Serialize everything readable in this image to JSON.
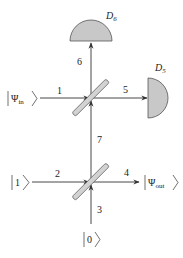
{
  "diagram": {
    "type": "optical-interferometer",
    "colors": {
      "beam": "#333333",
      "detector_fill": "#c8c8c8",
      "detector_stroke": "#555555",
      "splitter_fill": "#d2d2d2",
      "splitter_stroke": "#555555"
    },
    "detectors": [
      {
        "id": "D6",
        "label": "D",
        "subscript": "6"
      },
      {
        "id": "D5",
        "label": "D",
        "subscript": "5"
      }
    ],
    "states": {
      "psi_in": {
        "symbol": "Ψ",
        "subscript": "in"
      },
      "psi_out": {
        "symbol": "Ψ",
        "subscript": "out"
      },
      "one": {
        "symbol": "1"
      },
      "zero": {
        "symbol": "0"
      }
    },
    "beam_labels": {
      "b1": "1",
      "b2": "2",
      "b3": "3",
      "b4": "4",
      "b5": "5",
      "b6": "6",
      "b7": "7"
    },
    "beam_splitters": [
      {
        "id": "upper",
        "inputs": [
          "1",
          "7"
        ],
        "outputs": [
          "5",
          "6"
        ]
      },
      {
        "id": "lower",
        "inputs": [
          "2",
          "3"
        ],
        "outputs": [
          "4",
          "7"
        ]
      }
    ]
  }
}
